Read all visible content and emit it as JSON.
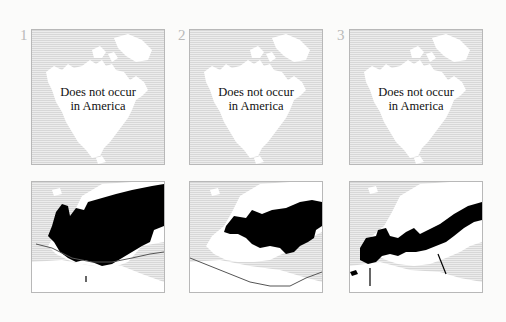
{
  "figure": {
    "columns": [
      {
        "number": "1",
        "america": {
          "caption_line1": "Does not occur",
          "caption_line2": "in America"
        },
        "europe": {
          "range_fill": "#000000",
          "has_boundary_line": true
        }
      },
      {
        "number": "2",
        "america": {
          "caption_line1": "Does not occur",
          "caption_line2": "in America"
        },
        "europe": {
          "range_fill": "#000000",
          "has_boundary_line": true
        }
      },
      {
        "number": "3",
        "america": {
          "caption_line1": "Does not occur",
          "caption_line2": "in America"
        },
        "europe": {
          "range_fill": "#000000",
          "has_boundary_line": false
        }
      }
    ],
    "colors": {
      "sea_hatch": "#d7d7d7",
      "land": "#ffffff",
      "range": "#000000",
      "number": "#b9b9b9",
      "border": "#b8b8b8"
    }
  }
}
